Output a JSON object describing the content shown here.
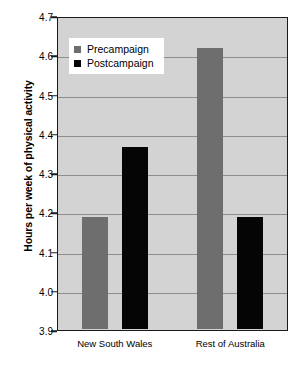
{
  "chart_data": {
    "type": "bar",
    "title": "",
    "xlabel": "",
    "ylabel": "Hours per week of physical activity",
    "categories": [
      "New South Wales",
      "Rest of Australia"
    ],
    "series": [
      {
        "name": "Precampaign",
        "color": "#6e6e6e",
        "values": [
          4.19,
          4.62
        ]
      },
      {
        "name": "Postcampaign",
        "color": "#050505",
        "values": [
          4.37,
          4.19
        ]
      }
    ],
    "ylim": [
      3.9,
      4.7
    ],
    "ytick_labels": [
      "4.7",
      "4.6",
      "4.5",
      "4.4",
      "4.3",
      "4.2",
      "4.1",
      "4.0",
      "3.9"
    ],
    "ytick_values": [
      4.7,
      4.6,
      4.5,
      4.4,
      4.3,
      4.2,
      4.1,
      4.0,
      3.9
    ],
    "grid": true,
    "legend_position": "top-left",
    "plot_background": "#d3d3d3"
  }
}
